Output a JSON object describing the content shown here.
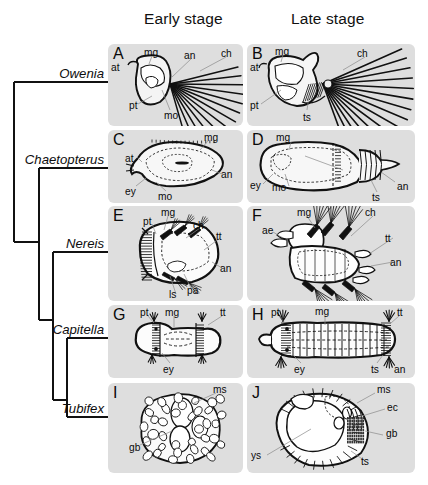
{
  "figure": {
    "background_color": "#ffffff",
    "panel_background": "#dedede",
    "ink_color": "#0a0a0a"
  },
  "columns": {
    "early": "Early stage",
    "late": "Late stage"
  },
  "cladogram": {
    "taxa": [
      {
        "name": "Owenia",
        "label_x": 104,
        "label_y": 82,
        "branch_x": 14
      },
      {
        "name": "Chaetopterus",
        "label_x": 104,
        "label_y": 168,
        "branch_x": 39
      },
      {
        "name": "Nereis",
        "label_x": 104,
        "label_y": 252,
        "branch_x": 53
      },
      {
        "name": "Capitella",
        "label_x": 104,
        "label_y": 338,
        "branch_x": 67
      },
      {
        "name": "Tubifex",
        "label_x": 104,
        "label_y": 417,
        "branch_x": 67
      }
    ],
    "nodes": [
      {
        "x": 14,
        "y_top": 82,
        "y_bottom": 242
      },
      {
        "x": 39,
        "y_top": 168,
        "y_bottom": 320
      },
      {
        "x": 53,
        "y_top": 252,
        "y_bottom": 400
      },
      {
        "x": 67,
        "y_top": 338,
        "y_bottom": 417
      }
    ]
  },
  "panels": [
    {
      "letter": "A",
      "taxon": "Owenia",
      "stage": "early",
      "box": {
        "x": 108,
        "y": 44,
        "w": 135,
        "h": 82
      },
      "annotations": [
        {
          "text": "mg",
          "x": 36,
          "y": 4
        },
        {
          "text": "an",
          "x": 76,
          "y": 7
        },
        {
          "text": "ch",
          "x": 113,
          "y": 5
        },
        {
          "text": "at",
          "x": 3,
          "y": 19
        },
        {
          "text": "pt",
          "x": 21,
          "y": 57
        },
        {
          "text": "mo",
          "x": 56,
          "y": 67
        }
      ]
    },
    {
      "letter": "B",
      "taxon": "Owenia",
      "stage": "late",
      "box": {
        "x": 247,
        "y": 44,
        "w": 168,
        "h": 82
      },
      "annotations": [
        {
          "text": "mg",
          "x": 28,
          "y": 3
        },
        {
          "text": "ch",
          "x": 110,
          "y": 5
        },
        {
          "text": "at",
          "x": 3,
          "y": 19
        },
        {
          "text": "pt",
          "x": 3,
          "y": 57
        },
        {
          "text": "ts",
          "x": 56,
          "y": 69
        }
      ]
    },
    {
      "letter": "C",
      "taxon": "Chaetopterus",
      "stage": "early",
      "box": {
        "x": 108,
        "y": 130,
        "w": 135,
        "h": 73
      },
      "annotations": [
        {
          "text": "mg",
          "x": 96,
          "y": 3
        },
        {
          "text": "at",
          "x": 17,
          "y": 24
        },
        {
          "text": "an",
          "x": 113,
          "y": 40
        },
        {
          "text": "ey",
          "x": 17,
          "y": 57
        },
        {
          "text": "mo",
          "x": 50,
          "y": 62
        }
      ]
    },
    {
      "letter": "D",
      "taxon": "Chaetopterus",
      "stage": "late",
      "box": {
        "x": 247,
        "y": 130,
        "w": 168,
        "h": 73
      },
      "annotations": [
        {
          "text": "mg",
          "x": 29,
          "y": 3
        },
        {
          "text": "ey",
          "x": 3,
          "y": 51
        },
        {
          "text": "mo",
          "x": 25,
          "y": 53
        },
        {
          "text": "an",
          "x": 150,
          "y": 52
        },
        {
          "text": "ts",
          "x": 125,
          "y": 63
        }
      ]
    },
    {
      "letter": "E",
      "taxon": "Nereis",
      "stage": "early",
      "box": {
        "x": 108,
        "y": 206,
        "w": 135,
        "h": 95
      },
      "annotations": [
        {
          "text": "mg",
          "x": 53,
          "y": 2
        },
        {
          "text": "pt",
          "x": 35,
          "y": 11
        },
        {
          "text": "ch",
          "x": 85,
          "y": 15
        },
        {
          "text": "tt",
          "x": 108,
          "y": 26
        },
        {
          "text": "an",
          "x": 112,
          "y": 58
        },
        {
          "text": "ls",
          "x": 61,
          "y": 84
        },
        {
          "text": "pa",
          "x": 79,
          "y": 80
        }
      ]
    },
    {
      "letter": "F",
      "taxon": "Nereis",
      "stage": "late",
      "box": {
        "x": 247,
        "y": 206,
        "w": 168,
        "h": 95
      },
      "annotations": [
        {
          "text": "mg",
          "x": 50,
          "y": 2
        },
        {
          "text": "ch",
          "x": 118,
          "y": 2
        },
        {
          "text": "ae",
          "x": 15,
          "y": 20
        },
        {
          "text": "tt",
          "x": 138,
          "y": 28
        },
        {
          "text": "an",
          "x": 143,
          "y": 52
        }
      ]
    },
    {
      "letter": "G",
      "taxon": "Capitella",
      "stage": "early",
      "box": {
        "x": 108,
        "y": 305,
        "w": 135,
        "h": 73
      },
      "annotations": [
        {
          "text": "pt",
          "x": 32,
          "y": 3
        },
        {
          "text": "mg",
          "x": 57,
          "y": 3
        },
        {
          "text": "tt",
          "x": 112,
          "y": 3
        },
        {
          "text": "ey",
          "x": 55,
          "y": 60
        }
      ]
    },
    {
      "letter": "H",
      "taxon": "Capitella",
      "stage": "late",
      "box": {
        "x": 247,
        "y": 305,
        "w": 168,
        "h": 73
      },
      "annotations": [
        {
          "text": "pt",
          "x": 24,
          "y": 3
        },
        {
          "text": "mg",
          "x": 68,
          "y": 2
        },
        {
          "text": "tt",
          "x": 150,
          "y": 3
        },
        {
          "text": "ey",
          "x": 47,
          "y": 60
        },
        {
          "text": "ts",
          "x": 124,
          "y": 60
        },
        {
          "text": "an",
          "x": 147,
          "y": 60
        }
      ]
    },
    {
      "letter": "I",
      "taxon": "Tubifex",
      "stage": "early",
      "box": {
        "x": 108,
        "y": 383,
        "w": 135,
        "h": 90
      },
      "annotations": [
        {
          "text": "ms",
          "x": 105,
          "y": 2
        },
        {
          "text": "gb",
          "x": 21,
          "y": 60
        }
      ]
    },
    {
      "letter": "J",
      "taxon": "Tubifex",
      "stage": "late",
      "box": {
        "x": 247,
        "y": 383,
        "w": 168,
        "h": 90
      },
      "annotations": [
        {
          "text": "ms",
          "x": 130,
          "y": 2
        },
        {
          "text": "ec",
          "x": 140,
          "y": 20
        },
        {
          "text": "gb",
          "x": 139,
          "y": 46
        },
        {
          "text": "ys",
          "x": 4,
          "y": 68
        },
        {
          "text": "ts",
          "x": 114,
          "y": 74
        }
      ]
    }
  ]
}
